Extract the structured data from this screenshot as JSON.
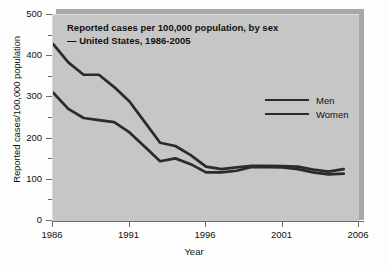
{
  "chart_data": {
    "type": "line",
    "title": "Reported cases per 100,000 population, by sex\n— United States, 1986-2005",
    "xlabel": "Year",
    "ylabel": "Reported cases/100,000 population",
    "xlim": [
      1986,
      2006
    ],
    "ylim": [
      0,
      500
    ],
    "xticks": [
      1986,
      1991,
      1996,
      2001,
      2006
    ],
    "yticks": [
      0,
      100,
      200,
      300,
      400,
      500
    ],
    "y_minor_ticks": [
      50,
      150,
      250,
      350,
      450
    ],
    "grid": false,
    "legend_position": "center-right",
    "x": [
      1986,
      1987,
      1988,
      1989,
      1990,
      1991,
      1992,
      1993,
      1994,
      1995,
      1996,
      1997,
      1998,
      1999,
      2000,
      2001,
      2002,
      2003,
      2004,
      2005
    ],
    "series": [
      {
        "name": "Men",
        "color": "#2b2b2b",
        "values": [
          430,
          385,
          355,
          355,
          325,
          290,
          240,
          190,
          182,
          160,
          132,
          126,
          130,
          134,
          134,
          133,
          132,
          125,
          120,
          126
        ]
      },
      {
        "name": "Women",
        "color": "#2b2b2b",
        "values": [
          312,
          272,
          250,
          245,
          240,
          215,
          180,
          145,
          152,
          138,
          118,
          118,
          122,
          131,
          131,
          130,
          126,
          118,
          113,
          115
        ]
      }
    ]
  },
  "legend": {
    "entries": [
      {
        "label": "Men"
      },
      {
        "label": "Women"
      }
    ]
  },
  "colors": {
    "plot_background": "#c6c6c6",
    "line": "#2b2b2b",
    "axis": "#6a6a6a",
    "text": "#111111"
  }
}
